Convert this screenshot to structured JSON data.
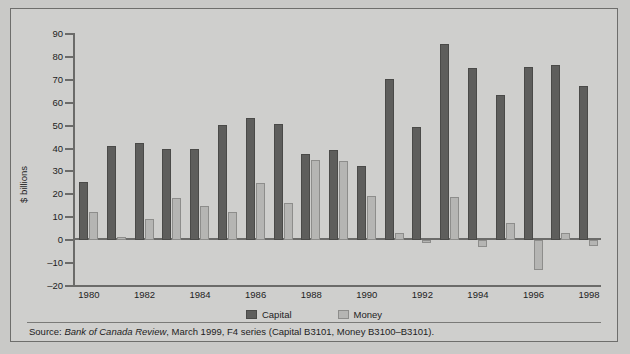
{
  "chart_data": {
    "type": "bar",
    "title": "",
    "xlabel": "",
    "ylabel": "$ billions",
    "ylim": [
      -20,
      90
    ],
    "yticks": [
      90,
      80,
      70,
      60,
      50,
      40,
      30,
      20,
      10,
      0,
      -10,
      -20
    ],
    "ytick_labels": [
      "90",
      "80",
      "70",
      "60",
      "50",
      "40",
      "30",
      "20",
      "10",
      "0",
      "–10",
      "–20"
    ],
    "grid": false,
    "legend_position": "bottom-center",
    "categories": [
      "1980",
      "1981",
      "1982",
      "1983",
      "1984",
      "1985",
      "1986",
      "1987",
      "1988",
      "1989",
      "1990",
      "1991",
      "1992",
      "1993",
      "1994",
      "1995",
      "1996",
      "1997",
      "1998"
    ],
    "xtick_labels": [
      "1980",
      "1982",
      "1984",
      "1986",
      "1988",
      "1990",
      "1992",
      "1994",
      "1996",
      "1998"
    ],
    "series": [
      {
        "name": "Capital",
        "color": "#5e5e5c",
        "values": [
          25.5,
          41,
          42.5,
          39.8,
          39.6,
          50.4,
          53.5,
          50.5,
          37.8,
          39.5,
          32.5,
          70.5,
          49.5,
          85.5,
          75,
          63.5,
          75.5,
          76.5,
          67.5
        ]
      },
      {
        "name": "Money",
        "color": "#b5b5b3",
        "values": [
          12.2,
          1.2,
          9.2,
          18.6,
          14.8,
          12.5,
          25,
          16.2,
          34.8,
          34.5,
          19.3,
          3.3,
          -1.2,
          18.8,
          -2.8,
          7.5,
          -13,
          3.1,
          -2.5
        ]
      }
    ]
  },
  "axis": {
    "y_title": "$ billions"
  },
  "legend": {
    "items": [
      {
        "label": "Capital",
        "color": "#5e5e5c"
      },
      {
        "label": "Money",
        "color": "#b5b5b3"
      }
    ]
  },
  "source": {
    "prefix": "Source: ",
    "italic": "Bank of Canada Review",
    "suffix": ", March 1999, F4 series (Capital B3101, Money B3100–B3101)."
  }
}
